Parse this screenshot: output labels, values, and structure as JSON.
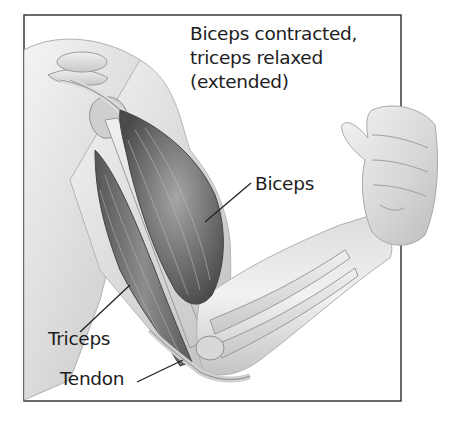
{
  "figure": {
    "title_lines": [
      "Biceps contracted,",
      "triceps relaxed",
      "(extended)"
    ],
    "labels": {
      "biceps": "Biceps",
      "triceps": "Triceps",
      "tendon": "Tendon"
    },
    "colors": {
      "frame": "#3a3a3a",
      "text": "#1d1d1d",
      "skin_light": "#ececec",
      "skin_mid": "#c9c9c9",
      "muscle_dark": "#5e5e5e",
      "muscle_mid": "#8a8a8a",
      "bone": "#e2e2e2",
      "leader_line": "#222222"
    }
  }
}
